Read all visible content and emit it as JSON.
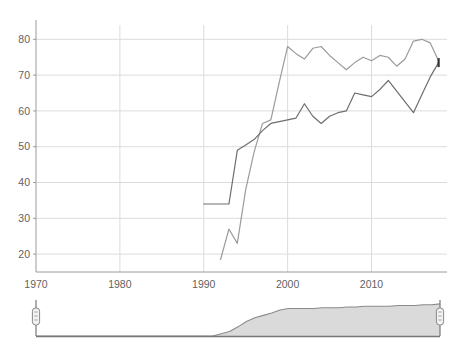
{
  "chart_data": {
    "type": "line",
    "title": "",
    "subtitle": "",
    "xlabel": "",
    "ylabel": "",
    "xlim": [
      1970,
      2019
    ],
    "ylim": [
      15,
      84
    ],
    "grid": true,
    "legend": "none",
    "x_ticks": [
      "1970",
      "1980",
      "1990",
      "2000",
      "2010"
    ],
    "x_tick_values": [
      1970,
      1980,
      1990,
      2000,
      2010
    ],
    "y_ticks": [
      "20",
      "30",
      "40",
      "50",
      "60",
      "70",
      "80"
    ],
    "y_tick_values": [
      20,
      30,
      40,
      50,
      60,
      70,
      80
    ],
    "series": [
      {
        "name": "series-upper",
        "color": "#9b9b9b",
        "x": [
          1992,
          1993,
          1994,
          1995,
          1996,
          1997,
          1998,
          1999,
          2000,
          2001,
          2002,
          2003,
          2004,
          2005,
          2006,
          2007,
          2008,
          2009,
          2010,
          2011,
          2012,
          2013,
          2014,
          2015,
          2016,
          2017,
          2018
        ],
        "values": [
          18.5,
          27.0,
          23.0,
          38.0,
          48.5,
          56.5,
          57.5,
          68.0,
          78.0,
          76.0,
          74.5,
          77.5,
          78.0,
          75.5,
          73.5,
          71.5,
          73.5,
          75.0,
          74.0,
          75.5,
          75.0,
          72.5,
          74.5,
          79.5,
          80.0,
          79.0,
          74.0
        ]
      },
      {
        "name": "series-lower",
        "color": "#6e6e6e",
        "x": [
          1990,
          1991,
          1992,
          1993,
          1994,
          1995,
          1996,
          1997,
          1998,
          1999,
          2000,
          2001,
          2002,
          2003,
          2004,
          2005,
          2006,
          2007,
          2008,
          2009,
          2010,
          2011,
          2012,
          2013,
          2014,
          2015,
          2016,
          2017,
          2018
        ],
        "values": [
          34.0,
          34.0,
          34.0,
          34.0,
          49.0,
          50.5,
          52.0,
          54.5,
          56.5,
          57.0,
          57.5,
          58.0,
          62.0,
          58.5,
          56.5,
          58.5,
          59.5,
          60.0,
          65.0,
          64.5,
          64.0,
          66.0,
          68.5,
          65.5,
          62.5,
          59.5,
          64.5,
          69.5,
          73.5
        ]
      }
    ],
    "end_marker": {
      "x": 2018,
      "y": 73.5,
      "color": "#333333"
    }
  },
  "range_slider": {
    "name": "date-range-slider",
    "left_handle_label": "",
    "right_handle_label": "",
    "left_handle_position_pct": 0,
    "right_handle_position_pct": 100,
    "overview_fill_color": "#d4d4d4",
    "overview_line_color": "#8a8a8a",
    "overview_x": [
      1970,
      1991,
      1992,
      1993,
      1994,
      1995,
      1996,
      1997,
      1998,
      1999,
      2000,
      2001,
      2002,
      2003,
      2004,
      2005,
      2006,
      2007,
      2008,
      2009,
      2010,
      2011,
      2012,
      2013,
      2014,
      2015,
      2016,
      2017,
      2018
    ],
    "overview_values": [
      0,
      0,
      3,
      6,
      12,
      19,
      24,
      27,
      30,
      34,
      36,
      36,
      36,
      36,
      37,
      37,
      37,
      38,
      38,
      39,
      39,
      39,
      39,
      40,
      40,
      40,
      41,
      41,
      42
    ]
  },
  "colors": {
    "gridline": "#dcdcdc",
    "axis": "#9a9a9a",
    "tick_text": "#5f5f5f",
    "slider_track": "#777777",
    "slider_handle_fill": "#f2f2f2",
    "slider_handle_stroke": "#888888"
  }
}
